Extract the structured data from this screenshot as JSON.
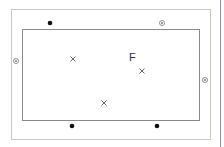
{
  "diagram": {
    "label_F": "F",
    "outer_rect": {
      "x": 11,
      "y": 9,
      "w": 199,
      "h": 130,
      "stroke": "#c8c8c8"
    },
    "inner_rect": {
      "x": 22,
      "y": 29,
      "w": 177,
      "h": 91,
      "stroke": "#8a8a8a"
    },
    "filled_dots": [
      [
        50,
        23
      ],
      [
        72,
        126
      ],
      [
        157,
        126
      ]
    ],
    "circled_dots": [
      [
        162,
        23
      ],
      [
        16,
        61
      ],
      [
        205,
        80
      ]
    ],
    "crosses": [
      [
        73,
        59
      ],
      [
        142,
        71
      ],
      [
        104,
        103
      ]
    ],
    "colors": {
      "dot": "#111111",
      "circled": "#888888",
      "cross": "#555555"
    }
  }
}
